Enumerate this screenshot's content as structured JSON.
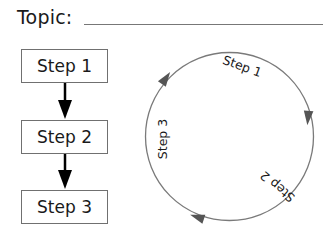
{
  "topic": {
    "label": "Topic:",
    "value": ""
  },
  "linear_steps": [
    {
      "label": "Step 1"
    },
    {
      "label": "Step 2"
    },
    {
      "label": "Step 3"
    }
  ],
  "cycle": {
    "steps": [
      {
        "label": "Step 1"
      },
      {
        "label": "Step 2"
      },
      {
        "label": "Step 3"
      }
    ],
    "direction": "clockwise"
  },
  "colors": {
    "text": "#1a1a1a",
    "line": "#777777",
    "arrow_fill_linear": "#000000",
    "arrow_fill_cycle": "#555555"
  }
}
